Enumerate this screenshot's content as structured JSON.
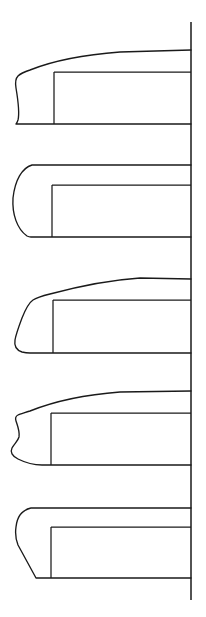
{
  "figure": {
    "title": "Vehicle Front-End Profile Variants",
    "canvas": {
      "width": 206,
      "height": 617
    },
    "background_color": "#ffffff",
    "line_color": "#1a1a1a"
  },
  "datum": {
    "name": "vertical-datum-line",
    "x": 191,
    "y_top": 22,
    "y_bottom": 600,
    "label": ""
  },
  "variants": [
    {
      "id": "variant-1",
      "label": "",
      "nose_style": "blunt-vertical-wavy",
      "roof_y": 52,
      "belt_y": 72,
      "floor_y": 124,
      "nose_x": 16,
      "pillar_x": 54,
      "roof_curve": "gentle-convex-rise",
      "roof_outline": "M 191 50 L 120 52 C 80 55 50 62 30 70 C 24 72 20 74 18 76 C 16 78 15 82 16 88 C 18 100 20 112 18 120 C 17 123 16 124 16 124 L 191 124",
      "belt_line": "M 54 72 L 191 72",
      "pillar_line": "M 54 72 L 54 124"
    },
    {
      "id": "variant-2",
      "label": "",
      "nose_style": "full-round-elliptical",
      "roof_y": 165,
      "belt_y": 185,
      "floor_y": 237,
      "nose_x": 13,
      "pillar_x": 52,
      "roof_curve": "flat-horizontal",
      "roof_outline": "M 191 165 L 32 165 C 22 168 15 180 13 198 C 12 214 17 229 27 236 C 29 237 30 237 31 237 L 191 237",
      "belt_line": "M 52 185 L 191 185",
      "pillar_line": "M 52 185 L 52 237"
    },
    {
      "id": "variant-3",
      "label": "",
      "nose_style": "raked-wedge-chamfer",
      "roof_y": 277,
      "belt_y": 300,
      "floor_y": 352,
      "nose_x": 14,
      "pillar_x": 53,
      "roof_curve": "strong-convex-taper",
      "roof_outline": "M 191 279 L 140 278 C 110 280 80 286 50 294 C 42 296 36 298 33 300 C 30 302 26 308 22 318 C 19 326 16 334 15 340 C 14 346 16 350 22 352 C 26 353 28 353 30 353 L 191 353",
      "belt_line": "M 53 300 L 191 300",
      "pillar_line": "M 53 300 L 53 353"
    },
    {
      "id": "variant-4",
      "label": "",
      "nose_style": "concave-s-curve-prow",
      "roof_y": 393,
      "belt_y": 413,
      "floor_y": 465,
      "nose_x": 11,
      "pillar_x": 51,
      "roof_curve": "convex-arched",
      "roof_outline": "M 191 391 L 120 392 C 80 395 50 403 30 411 C 24 413 20 414 18 415 C 16 416 15 418 16 421 C 18 427 20 432 19 437 C 18 441 14 444 12 448 C 10 452 12 456 18 459 C 26 463 34 465 42 465 L 191 465",
      "belt_line": "M 51 413 L 191 413",
      "pillar_line": "M 51 413 L 51 465"
    },
    {
      "id": "variant-5",
      "label": "",
      "nose_style": "rounded-corner-slanted-face",
      "roof_y": 508,
      "belt_y": 527,
      "floor_y": 578,
      "nose_x": 16,
      "pillar_x": 51,
      "roof_curve": "flat-horizontal",
      "roof_outline": "M 191 508 L 31 508 C 22 510 17 517 16 527 C 15 534 16 540 18 545 L 36 578 L 191 578",
      "belt_line": "M 51 527 L 191 527",
      "pillar_line": "M 51 527 L 51 578"
    }
  ]
}
